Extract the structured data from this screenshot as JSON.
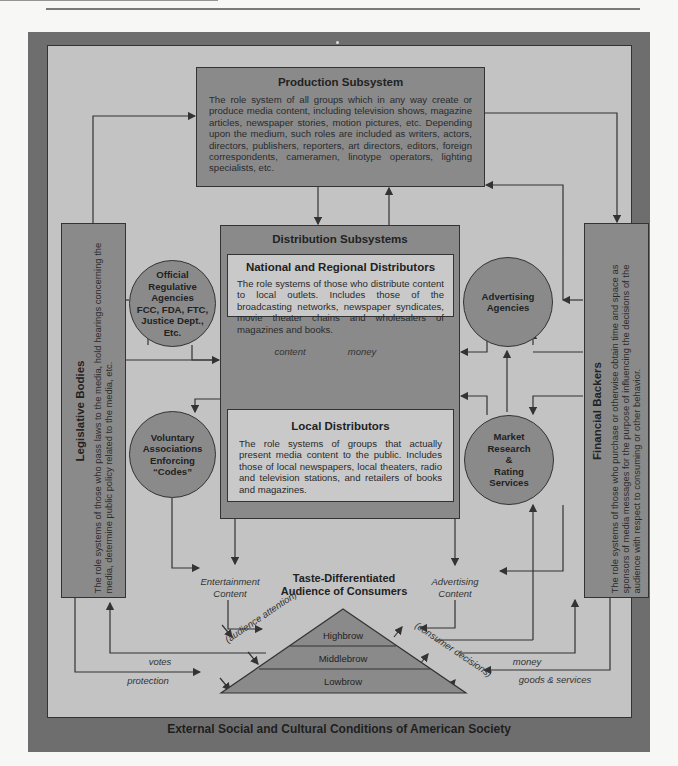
{
  "page": {
    "header_fragment": "MASS COMMUNICATION",
    "footer_title": "External Social and Cultural Conditions of American Society"
  },
  "production": {
    "title": "Production Subsystem",
    "body": "The role system of all groups which in any way create or produce media content, including television shows, magazine articles, newspaper stories, motion pictures, etc. Depending upon the medium, such roles are included as writers, actors, directors, publishers, reporters, art directors, editors, foreign correspondents, cameramen, linotype operators, lighting specialists, etc."
  },
  "distribution": {
    "title": "Distribution Subsystems",
    "national": {
      "title": "National and Regional Distributors",
      "body": "The role systems of those who distribute content to local outlets. Includes those of the broadcasting networks, newspaper syndicates, movie theater chains and wholesalers of magazines and books."
    },
    "local": {
      "title": "Local Distributors",
      "body": "The role systems of groups that actually present media content to the public. Includes those of local newspapers, local theaters, radio and television stations, and retailers of books and magazines."
    },
    "flow_down": "content",
    "flow_up": "money"
  },
  "legislative": {
    "title": "Legislative Bodies",
    "body": "The role systems of those who pass laws to the media, hold hearings concerning the media, determine public policy related to the media, etc."
  },
  "financial": {
    "title": "Financial Backers",
    "body": "The role systems of those who purchase or otherwise obtain time and space as sponsors of media messages for the purpose of influencing the decisions of the audience with respect to consuming or other behavior."
  },
  "circles": {
    "regulative": [
      "Official",
      "Regulative",
      "Agencies",
      "FCC, FDA, FTC,",
      "Justice Dept.,",
      "Etc."
    ],
    "voluntary": [
      "Voluntary",
      "Associations",
      "Enforcing",
      "“Codes”"
    ],
    "advertising": [
      "Advertising",
      "Agencies"
    ],
    "market": [
      "Market",
      "Research",
      "&",
      "Rating",
      "Services"
    ]
  },
  "audience": {
    "title_line1": "Taste-Differentiated",
    "title_line2": "Audience of Consumers",
    "tiers": [
      "Highbrow",
      "Middlebrow",
      "Lowbrow"
    ],
    "left_slope": "(audience attention)",
    "right_slope": "(consumer decisions)"
  },
  "flows": {
    "entertainment_1": "Entertainment",
    "entertainment_2": "Content",
    "advertising_1": "Advertising",
    "advertising_2": "Content",
    "votes": "votes",
    "protection": "protection",
    "money": "money",
    "goods_services": "goods & services"
  },
  "colors": {
    "frame": "#6e6e6e",
    "panel": "#c3c3c3",
    "dark_box": "#8a8a8a",
    "light_box": "#c9c9c9",
    "line": "#333333"
  }
}
